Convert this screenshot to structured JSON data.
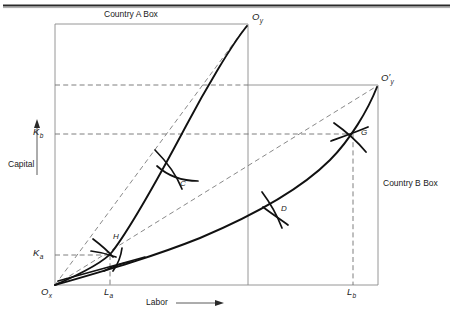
{
  "figure": {
    "type": "edgeworth-box-diagram",
    "title_top": "Country A Box",
    "title_right": "Country B Box",
    "axis": {
      "y_label": "Capital",
      "x_label": "Labor",
      "y_arrow": "up-arrow",
      "x_arrow": "right-arrow"
    },
    "origins": {
      "ox": "O",
      "ox_sub": "x",
      "oy": "O",
      "oy_sub": "y",
      "oy_prime": "O",
      "oy_prime_sub": "y",
      "prime_mark": "′"
    },
    "axis_ticks": {
      "k_a": "K",
      "k_a_sub": "a",
      "k_b": "K",
      "k_b_sub": "b",
      "l_a": "L",
      "l_a_sub": "a",
      "l_b": "L",
      "l_b_sub": "b"
    },
    "points": [
      {
        "id": "point-c",
        "label": "C"
      },
      {
        "id": "point-d",
        "label": "D"
      },
      {
        "id": "point-g",
        "label": "G"
      },
      {
        "id": "point-h",
        "label": "H"
      }
    ],
    "colors": {
      "ink": "#1a1a1a",
      "curve": "#111111",
      "box_line": "#8a8a8a",
      "dashed": "#6f6f6f",
      "rule": "#2a2a2a",
      "background": "#ffffff"
    },
    "boxes": {
      "country_a": {
        "x0": 55,
        "y0": 24,
        "x1": 248,
        "y1": 285
      },
      "country_b": {
        "x0": 55,
        "y0": 85,
        "x1": 378,
        "y1": 285
      }
    },
    "curves": {
      "contract_curve_a": "convex arc from Ox to Oy through H and C",
      "contract_curve_b": "convex arc from Ox to Oy-prime through H, D and G",
      "diagonal_a": "dashed straight line Ox to Oy",
      "diagonal_b": "dashed straight line Ox to Oy-prime"
    }
  }
}
